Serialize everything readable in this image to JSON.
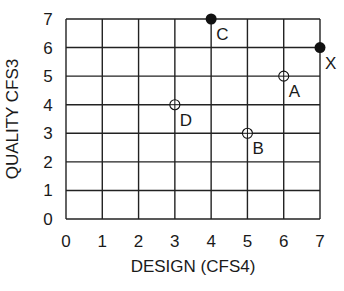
{
  "chart_data": {
    "type": "scatter",
    "title": "",
    "xlabel": "DESIGN (CFS4)",
    "ylabel": "QUALITY CFS3",
    "xlim": [
      0,
      7
    ],
    "ylim": [
      0,
      7
    ],
    "grid": true,
    "x_ticks": [
      "0",
      "1",
      "2",
      "3",
      "4",
      "5",
      "6",
      "7"
    ],
    "y_ticks": [
      "0",
      "1",
      "2",
      "3",
      "4",
      "5",
      "6",
      "7"
    ],
    "points": [
      {
        "label": "C",
        "x": 4,
        "y": 7,
        "style": "filled"
      },
      {
        "label": "X",
        "x": 7,
        "y": 6,
        "style": "filled"
      },
      {
        "label": "A",
        "x": 6,
        "y": 5,
        "style": "open-crosshair"
      },
      {
        "label": "D",
        "x": 3,
        "y": 4,
        "style": "open-crosshair"
      },
      {
        "label": "B",
        "x": 5,
        "y": 3,
        "style": "open-crosshair"
      }
    ]
  },
  "colors": {
    "line": "#222222",
    "marker": "#111111",
    "background": "#ffffff"
  }
}
